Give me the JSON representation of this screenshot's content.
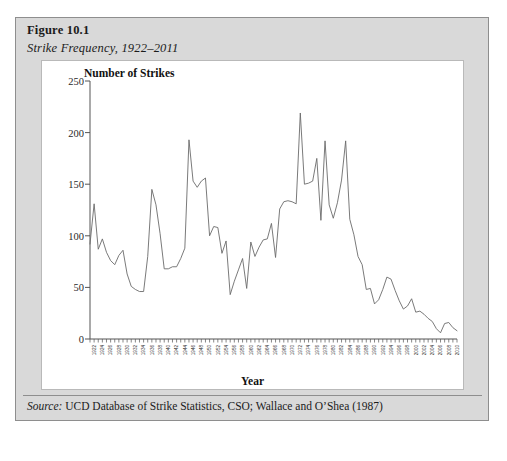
{
  "figure": {
    "label": "Figure 10.1",
    "subtitle": "Strike Frequency, 1922–2011",
    "source_word": "Source:",
    "source_text": " UCD Database of Strike Statistics, CSO; Wallace and O’Shea (1987)"
  },
  "chart_data": {
    "type": "line",
    "title": "Strike Frequency, 1922–2011",
    "xlabel": "Year",
    "ylabel": "Number of Strikes",
    "ylim": [
      0,
      250
    ],
    "yticks": [
      0,
      50,
      100,
      150,
      200,
      250
    ],
    "xlim": [
      1922,
      2011
    ],
    "xtick_step": 2,
    "grid": false,
    "legend": null,
    "line_color": "#6b6b6b",
    "x": [
      1922,
      1923,
      1924,
      1925,
      1926,
      1927,
      1928,
      1929,
      1930,
      1931,
      1932,
      1933,
      1934,
      1935,
      1936,
      1937,
      1938,
      1939,
      1940,
      1941,
      1942,
      1943,
      1944,
      1945,
      1946,
      1947,
      1948,
      1949,
      1950,
      1951,
      1952,
      1953,
      1954,
      1955,
      1956,
      1957,
      1958,
      1959,
      1960,
      1961,
      1962,
      1963,
      1964,
      1965,
      1966,
      1967,
      1968,
      1969,
      1970,
      1971,
      1972,
      1973,
      1974,
      1975,
      1976,
      1977,
      1978,
      1979,
      1980,
      1981,
      1982,
      1983,
      1984,
      1985,
      1986,
      1987,
      1988,
      1989,
      1990,
      1991,
      1992,
      1993,
      1994,
      1995,
      1996,
      1997,
      1998,
      1999,
      2000,
      2001,
      2002,
      2003,
      2004,
      2005,
      2006,
      2007,
      2008,
      2009,
      2010,
      2011
    ],
    "values": [
      92,
      131,
      87,
      97,
      84,
      76,
      72,
      81,
      86,
      63,
      51,
      48,
      46,
      46,
      80,
      145,
      130,
      102,
      68,
      68,
      70,
      70,
      78,
      88,
      193,
      153,
      147,
      153,
      156,
      100,
      109,
      108,
      83,
      95,
      43,
      56,
      67,
      78,
      49,
      94,
      80,
      89,
      96,
      97,
      112,
      79,
      126,
      133,
      134,
      133,
      131,
      219,
      150,
      151,
      153,
      175,
      115,
      192,
      130,
      117,
      132,
      154,
      192,
      116,
      101,
      80,
      72,
      48,
      49,
      34,
      38,
      48,
      60,
      58,
      47,
      37,
      29,
      32,
      39,
      26,
      27,
      24,
      20,
      17,
      10,
      6,
      15,
      16,
      11,
      8
    ],
    "peaks": [
      {
        "year": 1937,
        "value": 145
      },
      {
        "year": 1946,
        "value": 193
      },
      {
        "year": 1973,
        "value": 219
      },
      {
        "year": 1979,
        "value": 192
      },
      {
        "year": 1984,
        "value": 192
      }
    ]
  }
}
